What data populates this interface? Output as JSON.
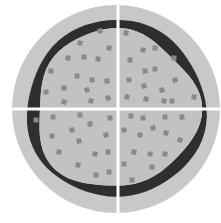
{
  "diagram": {
    "colors": {
      "background": "#ffffff",
      "outer_disc": "#c8c8c8",
      "inner_fill": "#c2c2c2",
      "ring": "#2e2e2e",
      "particle": "#8a8a8a",
      "divider": "#ffffff"
    },
    "disc": {
      "cx": 116,
      "cy": 109,
      "r": 104
    },
    "dividers": {
      "vertical_x": 118,
      "horizontal_y": 109,
      "width": 3
    },
    "quadrants": [
      {
        "id": "top-left",
        "label": ""
      },
      {
        "id": "top-right",
        "label": ""
      },
      {
        "id": "bottom-left",
        "label": ""
      },
      {
        "id": "bottom-right",
        "label": ""
      }
    ],
    "particles": [
      [
        100,
        31
      ],
      [
        80,
        43
      ],
      [
        109,
        48
      ],
      [
        68,
        58
      ],
      [
        84,
        57
      ],
      [
        98,
        59
      ],
      [
        51,
        71
      ],
      [
        77,
        76
      ],
      [
        92,
        80
      ],
      [
        107,
        81
      ],
      [
        64,
        88
      ],
      [
        46,
        92
      ],
      [
        87,
        90
      ],
      [
        108,
        98
      ],
      [
        64,
        102
      ],
      [
        91,
        101
      ],
      [
        126,
        33
      ],
      [
        143,
        50
      ],
      [
        155,
        48
      ],
      [
        174,
        58
      ],
      [
        130,
        60
      ],
      [
        155,
        69
      ],
      [
        145,
        71
      ],
      [
        129,
        80
      ],
      [
        144,
        86
      ],
      [
        162,
        90
      ],
      [
        175,
        80
      ],
      [
        127,
        97
      ],
      [
        146,
        99
      ],
      [
        164,
        101
      ],
      [
        194,
        97
      ],
      [
        172,
        101
      ],
      [
        36,
        120
      ],
      [
        53,
        117
      ],
      [
        80,
        115
      ],
      [
        110,
        118
      ],
      [
        72,
        130
      ],
      [
        90,
        124
      ],
      [
        52,
        136
      ],
      [
        79,
        141
      ],
      [
        106,
        135
      ],
      [
        59,
        152
      ],
      [
        95,
        154
      ],
      [
        108,
        152
      ],
      [
        78,
        165
      ],
      [
        96,
        175
      ],
      [
        109,
        172
      ],
      [
        131,
        116
      ],
      [
        143,
        118
      ],
      [
        165,
        117
      ],
      [
        182,
        117
      ],
      [
        124,
        130
      ],
      [
        140,
        135
      ],
      [
        153,
        128
      ],
      [
        166,
        133
      ],
      [
        180,
        140
      ],
      [
        134,
        152
      ],
      [
        150,
        154
      ],
      [
        165,
        154
      ],
      [
        124,
        164
      ],
      [
        152,
        167
      ],
      [
        132,
        180
      ]
    ]
  }
}
